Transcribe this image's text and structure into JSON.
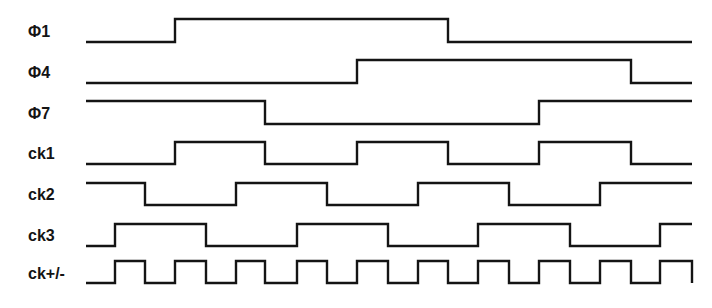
{
  "colors": {
    "line": "#141414",
    "background": "#ffffff"
  },
  "x_range": [
    86,
    692
  ],
  "signals": [
    {
      "name": "Φ1",
      "label_y": 33,
      "low_y": 42,
      "high_y": 19,
      "initial": "low",
      "transitions": [
        175,
        448
      ]
    },
    {
      "name": "Φ4",
      "label_y": 74,
      "low_y": 83,
      "high_y": 60,
      "initial": "low",
      "transitions": [
        357,
        631
      ]
    },
    {
      "name": "Φ7",
      "label_y": 115,
      "low_y": 124,
      "high_y": 101,
      "initial": "high",
      "transitions": [
        265,
        539
      ]
    },
    {
      "name": "ck1",
      "label_y": 155,
      "low_y": 164,
      "high_y": 142,
      "initial": "low",
      "transitions": [
        175,
        265,
        357,
        448,
        539,
        631
      ]
    },
    {
      "name": "ck2",
      "label_y": 196,
      "low_y": 205,
      "high_y": 183,
      "initial": "high",
      "transitions": [
        145,
        236,
        327,
        418,
        509,
        600
      ]
    },
    {
      "name": "ck3",
      "label_y": 237,
      "low_y": 246,
      "high_y": 224,
      "initial": "low",
      "transitions": [
        115,
        206,
        297,
        388,
        478,
        570,
        660
      ]
    },
    {
      "name": "ck+/-",
      "label_y": 275,
      "low_y": 283,
      "high_y": 261,
      "initial": "low",
      "transitions": [
        115,
        145,
        175,
        206,
        236,
        265,
        297,
        327,
        357,
        388,
        418,
        448,
        478,
        509,
        539,
        570,
        600,
        631,
        660,
        692
      ]
    }
  ]
}
